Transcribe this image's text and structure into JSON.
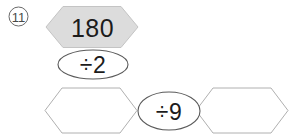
{
  "problem": {
    "number_label": "11",
    "label_icon": "circled-number-icon"
  },
  "flow": {
    "start": {
      "shape": "hexagon",
      "value": "180",
      "filled": true
    },
    "operations": [
      {
        "shape": "ellipse",
        "value": "÷2"
      },
      {
        "shape": "ellipse",
        "value": "÷9"
      }
    ],
    "answers": [
      {
        "shape": "hexagon",
        "value": "",
        "filled": false
      },
      {
        "shape": "hexagon",
        "value": "",
        "filled": false
      }
    ]
  },
  "colors": {
    "filled_hexagon_fill": "#dcdcdc",
    "filled_hexagon_stroke": "#c4c4c4",
    "empty_hexagon_stroke": "#b0b0b0",
    "ellipse_stroke": "#5a5a5a",
    "text": "#1c1c1c",
    "label_text": "#4a4a4a",
    "background": "#ffffff"
  }
}
